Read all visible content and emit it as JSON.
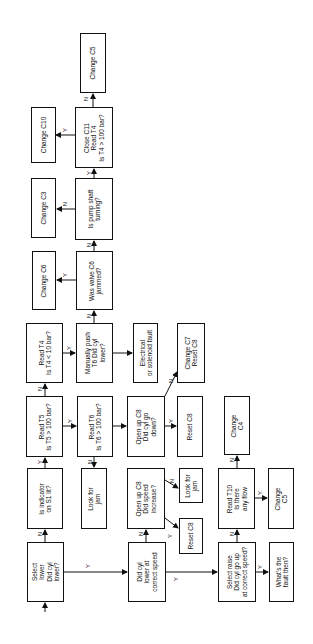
{
  "diagram": {
    "type": "flowchart",
    "orientation": "rotated -90deg",
    "nodes": [
      {
        "id": "change_c5_top",
        "lines": [
          "Change C5"
        ],
        "box": [
          80,
          33,
          26,
          60
        ]
      },
      {
        "id": "change_c10",
        "lines": [
          "Change C10"
        ],
        "box": [
          31,
          107,
          25,
          56
        ]
      },
      {
        "id": "close_c11",
        "lines": [
          "Close C11",
          "Read T4",
          "Is T4 > 100 bar?"
        ],
        "box": [
          75,
          107,
          38,
          61
        ]
      },
      {
        "id": "change_c3",
        "lines": [
          "Change C3"
        ],
        "box": [
          31,
          178,
          25,
          60
        ]
      },
      {
        "id": "pump_shaft",
        "lines": [
          "Is pump shaft",
          "turning?"
        ],
        "box": [
          75,
          178,
          38,
          62
        ]
      },
      {
        "id": "change_c6",
        "lines": [
          "Change C6"
        ],
        "box": [
          32,
          251,
          24,
          59
        ]
      },
      {
        "id": "valve_c6",
        "lines": [
          "Was valve C6",
          "jammed?"
        ],
        "box": [
          76,
          251,
          37,
          59
        ]
      },
      {
        "id": "read_t4",
        "lines": [
          "Read T4",
          "Is T4 < 10 bar?"
        ],
        "box": [
          26,
          323,
          37,
          60
        ]
      },
      {
        "id": "manual_push",
        "lines": [
          "Manually push",
          "T6  Did cyl",
          "lower?"
        ],
        "box": [
          76,
          323,
          37,
          60
        ]
      },
      {
        "id": "electrical_fault",
        "lines": [
          "Electrical",
          "or solenoid fault"
        ],
        "box": [
          133,
          323,
          25,
          60
        ]
      },
      {
        "id": "change_c7",
        "lines": [
          "Change C7",
          "Reset C8"
        ],
        "box": [
          177,
          323,
          28,
          60
        ]
      },
      {
        "id": "read_t5",
        "lines": [
          "Read T5",
          "Is T5 > 100 bar?"
        ],
        "box": [
          26,
          396,
          37,
          61
        ]
      },
      {
        "id": "read_t6",
        "lines": [
          "Read T6",
          "Is T6 > 100 bar?"
        ],
        "box": [
          77,
          396,
          36,
          61
        ]
      },
      {
        "id": "open_c8_down",
        "lines": [
          "Open up C8",
          "Did cyl go",
          "down?"
        ],
        "box": [
          127,
          396,
          38,
          61
        ]
      },
      {
        "id": "reset_c8_top",
        "lines": [
          "Reset C8"
        ],
        "box": [
          177,
          396,
          26,
          61
        ]
      },
      {
        "id": "change_c4",
        "lines": [
          "Change",
          "C4"
        ],
        "box": [
          224,
          396,
          26,
          59
        ]
      },
      {
        "id": "indicator_s1",
        "lines": [
          "Is indicator",
          "on S1 lit?"
        ],
        "box": [
          27,
          468,
          36,
          61
        ]
      },
      {
        "id": "look_jam_left",
        "lines": [
          "Look for",
          "jam"
        ],
        "box": [
          81,
          468,
          26,
          61
        ]
      },
      {
        "id": "open_c8_speed",
        "lines": [
          "Open up C8",
          "Did speed",
          "increase?"
        ],
        "box": [
          127,
          468,
          38,
          61
        ]
      },
      {
        "id": "look_jam_right",
        "lines": [
          "Look for",
          "jam"
        ],
        "box": [
          179,
          468,
          24,
          35
        ]
      },
      {
        "id": "reset_c8_low",
        "lines": [
          "Reset C8"
        ],
        "box": [
          179,
          518,
          24,
          36
        ]
      },
      {
        "id": "read_t10",
        "lines": [
          "Read T10",
          "Is there",
          "any flow"
        ],
        "box": [
          218,
          468,
          37,
          61
        ]
      },
      {
        "id": "change_c5_low",
        "lines": [
          "Change",
          "C5"
        ],
        "box": [
          268,
          468,
          26,
          61
        ]
      },
      {
        "id": "select_lower",
        "lines": [
          "Select",
          "lower",
          "Did cyl",
          "lower?"
        ],
        "box": [
          27,
          542,
          37,
          60
        ]
      },
      {
        "id": "did_cyl_lower",
        "lines": [
          "Did cyl",
          "lower at",
          "correct speed"
        ],
        "box": [
          128,
          542,
          38,
          60
        ]
      },
      {
        "id": "select_raise",
        "lines": [
          "Select raise",
          "Did cyl go up",
          "at correct speed?"
        ],
        "box": [
          218,
          542,
          38,
          60
        ]
      },
      {
        "id": "whats_fault",
        "lines": [
          "What's the",
          "fault then?"
        ],
        "box": [
          269,
          542,
          25,
          60
        ]
      }
    ],
    "edges": [
      {
        "from": "entry",
        "to": "select_lower",
        "label": ""
      },
      {
        "from": "select_lower",
        "to": "indicator_s1",
        "label": "N"
      },
      {
        "from": "select_lower",
        "to": "did_cyl_lower",
        "label": "Y"
      },
      {
        "from": "indicator_s1",
        "to": "read_t5",
        "label": "Y"
      },
      {
        "from": "read_t5",
        "to": "read_t4",
        "label": "N"
      },
      {
        "from": "read_t5",
        "to": "read_t6",
        "label": "Y"
      },
      {
        "from": "read_t6",
        "to": "look_jam_left",
        "label": "N"
      },
      {
        "from": "read_t6",
        "to": "open_c8_down",
        "label": ""
      },
      {
        "from": "open_c8_down",
        "to": "reset_c8_top",
        "label": "Y"
      },
      {
        "from": "open_c8_down",
        "to": "change_c7",
        "label": "N"
      },
      {
        "from": "read_t4",
        "to": "manual_push",
        "label": "Y"
      },
      {
        "from": "manual_push",
        "to": "electrical_fault",
        "label": ""
      },
      {
        "from": "manual_push",
        "to": "valve_c6",
        "label": "N"
      },
      {
        "from": "valve_c6",
        "to": "change_c6",
        "label": "Y"
      },
      {
        "from": "valve_c6",
        "to": "pump_shaft",
        "label": "N"
      },
      {
        "from": "pump_shaft",
        "to": "change_c3",
        "label": "N"
      },
      {
        "from": "pump_shaft",
        "to": "close_c11",
        "label": "Y"
      },
      {
        "from": "close_c11",
        "to": "change_c10",
        "label": "Y"
      },
      {
        "from": "close_c11",
        "to": "change_c5_top",
        "label": "N"
      },
      {
        "from": "did_cyl_lower",
        "to": "open_c8_speed",
        "label": "N"
      },
      {
        "from": "did_cyl_lower",
        "to": "select_raise",
        "label": "Y"
      },
      {
        "from": "open_c8_speed",
        "to": "look_jam_right",
        "label": "N"
      },
      {
        "from": "open_c8_speed",
        "to": "reset_c8_low",
        "label": "Y"
      },
      {
        "from": "select_raise",
        "to": "read_t10",
        "label": "N"
      },
      {
        "from": "select_raise",
        "to": "whats_fault",
        "label": "Y"
      },
      {
        "from": "read_t10",
        "to": "change_c4",
        "label": "N"
      },
      {
        "from": "read_t10",
        "to": "change_c5_low",
        "label": "Y"
      }
    ]
  }
}
